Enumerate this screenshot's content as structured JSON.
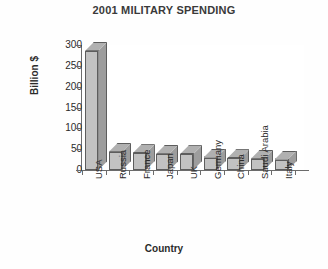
{
  "chart_data": {
    "type": "bar",
    "title": "2001 MILITARY SPENDING",
    "xlabel": "Country",
    "ylabel": "Billion $",
    "categories": [
      "USA",
      "Russia",
      "France",
      "Japan",
      "UK",
      "Germany",
      "China",
      "Saudi Arabia",
      "Italy"
    ],
    "values": [
      286,
      44,
      40,
      39,
      38,
      30,
      28,
      27,
      25
    ],
    "ylim": [
      0,
      300
    ],
    "yticks": [
      0,
      50,
      100,
      150,
      200,
      250,
      300
    ],
    "ytick_labels": [
      "0",
      "50",
      "100",
      "150",
      "200",
      "250",
      "300"
    ],
    "grid": false,
    "legend": false,
    "style": {
      "bar_front_color": "#c2c2c2",
      "bar_side_color": "#9d9d9d",
      "bar_top_color": "#b0b0b0",
      "bar_edge_color": "#5d5d5d",
      "axis_color": "#6b6b6b",
      "text_color": "#2b2b2b",
      "background": "#ffffff"
    }
  }
}
